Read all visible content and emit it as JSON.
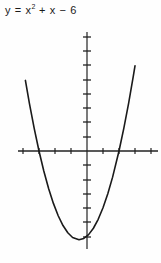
{
  "figure": {
    "title_plain": "y = x2 + x - 6",
    "title_lead": "y = x",
    "title_exp": "2",
    "title_tail": " + x  −  6",
    "axis_color": "#222222",
    "curve_color": "#1a1a1a",
    "background_color": "#fefefe"
  },
  "chart_data": {
    "type": "line",
    "equation": "y = x^2 + x - 6",
    "xlabel": "",
    "ylabel": "",
    "xlim": [
      -4.3,
      4.4
    ],
    "ylim": [
      -7.5,
      8.4
    ],
    "grid": false,
    "legend": "none",
    "tick_interval_x": 1,
    "tick_interval_y": 1,
    "x_tick_values": [
      -4,
      -3,
      -2,
      -1,
      1,
      2,
      3,
      4
    ],
    "y_tick_values": [
      -7,
      -6,
      -5,
      -4,
      -3,
      -2,
      -1,
      1,
      2,
      3,
      4,
      5,
      6,
      7,
      8
    ],
    "roots": [
      -3,
      2
    ],
    "vertex": [
      -0.5,
      -6.25
    ],
    "y_intercept": -6,
    "series": [
      {
        "name": "y = x² + x − 6",
        "x": [
          -3.85,
          -3.6,
          -3.3,
          -3.0,
          -2.7,
          -2.4,
          -2.1,
          -1.8,
          -1.5,
          -1.2,
          -0.9,
          -0.5,
          -0.2,
          0.1,
          0.4,
          0.7,
          1.0,
          1.3,
          1.6,
          2.0,
          2.3,
          2.6,
          2.9,
          3.0
        ],
        "y": [
          4.97,
          3.36,
          1.59,
          0.0,
          -1.41,
          -2.64,
          -3.69,
          -4.56,
          -5.25,
          -5.76,
          -6.09,
          -6.25,
          -6.16,
          -5.89,
          -5.44,
          -4.81,
          -4.0,
          -3.01,
          -1.84,
          0.0,
          1.59,
          3.36,
          5.31,
          6.0
        ]
      }
    ]
  }
}
